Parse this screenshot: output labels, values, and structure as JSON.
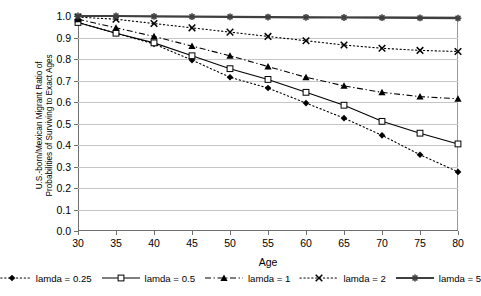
{
  "chart_data": {
    "type": "line",
    "title": "",
    "xlabel": "Age",
    "ylabel": "U.S.-born/Mexican Migrant Ratio of Probabilities of Surviving to Exact Ages",
    "ylabel_line1": "U.S.-born/Mexican Migrant Ratio of",
    "ylabel_line2": "Probabilities of Surviving to Exact Ages",
    "x": [
      30,
      35,
      40,
      45,
      50,
      55,
      60,
      65,
      70,
      75,
      80
    ],
    "xtick_labels": [
      "30",
      "35",
      "40",
      "45",
      "50",
      "55",
      "60",
      "65",
      "70",
      "75",
      "80"
    ],
    "ytick_labels": [
      "0.0",
      "0.1",
      "0.2",
      "0.3",
      "0.4",
      "0.5",
      "0.6",
      "0.7",
      "0.8",
      "0.9",
      "1.0"
    ],
    "ytick_values": [
      0.0,
      0.1,
      0.2,
      0.3,
      0.4,
      0.5,
      0.6,
      0.7,
      0.8,
      0.9,
      1.0
    ],
    "xlim": [
      30,
      80
    ],
    "ylim": [
      0.0,
      1.0
    ],
    "grid": "horizontal",
    "legend_position": "bottom",
    "series": [
      {
        "name": "lamda = 0.25",
        "marker": "filled-diamond",
        "linestyle": "dotted",
        "color": "#000000",
        "values": [
          0.97,
          0.92,
          0.87,
          0.795,
          0.715,
          0.665,
          0.595,
          0.525,
          0.445,
          0.355,
          0.275
        ]
      },
      {
        "name": "lamda = 0.5",
        "marker": "open-square",
        "linestyle": "solid",
        "color": "#000000",
        "values": [
          0.97,
          0.92,
          0.875,
          0.815,
          0.755,
          0.705,
          0.645,
          0.585,
          0.51,
          0.455,
          0.405
        ]
      },
      {
        "name": "lamda = 1",
        "marker": "filled-triangle",
        "linestyle": "dash-dot",
        "color": "#000000",
        "values": [
          0.985,
          0.945,
          0.905,
          0.86,
          0.815,
          0.765,
          0.715,
          0.675,
          0.645,
          0.625,
          0.615
        ]
      },
      {
        "name": "lamda = 2",
        "marker": "cross-x",
        "linestyle": "dotted",
        "color": "#000000",
        "values": [
          0.995,
          0.985,
          0.965,
          0.945,
          0.925,
          0.905,
          0.885,
          0.865,
          0.85,
          0.84,
          0.835
        ]
      },
      {
        "name": "lamda = 5",
        "marker": "star",
        "linestyle": "solid-thick",
        "color": "#3f3f3f",
        "values": [
          1.0,
          1.0,
          0.998,
          0.997,
          0.996,
          0.995,
          0.994,
          0.993,
          0.992,
          0.991,
          0.99
        ]
      }
    ]
  },
  "legend": {
    "entries": [
      {
        "label": "lamda = 0.25"
      },
      {
        "label": "lamda = 0.5"
      },
      {
        "label": "lamda = 1"
      },
      {
        "label": "lamda = 2"
      },
      {
        "label": "lamda = 5"
      }
    ]
  }
}
